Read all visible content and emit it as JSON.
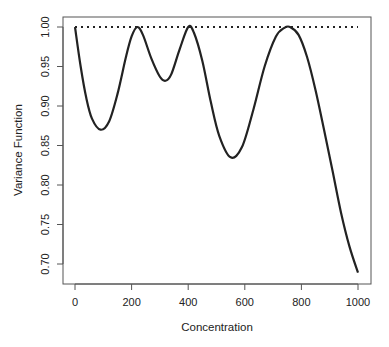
{
  "chart_data": {
    "type": "line",
    "title": "",
    "xlabel": "Concentration",
    "ylabel": "Variance Function",
    "xlim": [
      0,
      1000
    ],
    "ylim": [
      0.68,
      1.01
    ],
    "grid": false,
    "legend": null,
    "x_ticks": [
      "0",
      "200",
      "400",
      "600",
      "800",
      "1000"
    ],
    "y_ticks": [
      "0.70",
      "0.75",
      "0.80",
      "0.85",
      "0.90",
      "0.95",
      "1.00"
    ],
    "series": [
      {
        "name": "variance function",
        "style": "solid",
        "color": "#222222",
        "x": [
          0,
          20,
          40,
          60,
          90,
          120,
          150,
          180,
          200,
          220,
          240,
          270,
          300,
          320,
          340,
          370,
          400,
          420,
          450,
          480,
          510,
          550,
          590,
          630,
          670,
          710,
          740,
          760,
          790,
          820,
          850,
          880,
          910,
          940,
          970,
          1000
        ],
        "values": [
          1.0,
          0.95,
          0.91,
          0.884,
          0.87,
          0.88,
          0.915,
          0.962,
          0.988,
          1.0,
          0.99,
          0.96,
          0.937,
          0.932,
          0.94,
          0.972,
          1.0,
          0.993,
          0.957,
          0.905,
          0.862,
          0.835,
          0.848,
          0.895,
          0.95,
          0.988,
          0.999,
          1.0,
          0.99,
          0.962,
          0.92,
          0.87,
          0.818,
          0.765,
          0.722,
          0.689
        ]
      },
      {
        "name": "reference line",
        "style": "dotted",
        "color": "#222222",
        "x": [
          0,
          1000
        ],
        "values": [
          1.0,
          1.0
        ]
      }
    ]
  }
}
